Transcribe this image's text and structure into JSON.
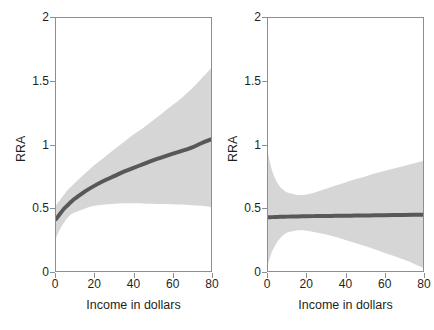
{
  "chart_data": [
    {
      "type": "line",
      "panel": "left",
      "title": "Real",
      "xlabel": "Income in dollars",
      "ylabel": "RRA",
      "xlim": [
        0,
        80
      ],
      "ylim": [
        0,
        2
      ],
      "xticks": [
        0,
        20,
        40,
        60,
        80
      ],
      "xtick_labels": [
        "0",
        "20",
        "40",
        "60",
        "80"
      ],
      "yticks": [
        0,
        0.5,
        1,
        1.5,
        2
      ],
      "ytick_labels": [
        "0",
        "0.5",
        "1",
        "1.5",
        "2"
      ],
      "grid": false,
      "legend": "none",
      "line_color": "#585858",
      "band_color": "#d6d6d6",
      "x": [
        0,
        2,
        4,
        6,
        8,
        10,
        15,
        20,
        25,
        30,
        35,
        40,
        45,
        50,
        55,
        60,
        65,
        70,
        75,
        80
      ],
      "series": [
        {
          "name": "fit",
          "values": [
            0.41,
            0.45,
            0.49,
            0.52,
            0.55,
            0.575,
            0.63,
            0.675,
            0.715,
            0.75,
            0.785,
            0.815,
            0.845,
            0.875,
            0.9,
            0.925,
            0.95,
            0.975,
            1.01,
            1.04
          ]
        },
        {
          "name": "ci_upper",
          "values": [
            0.52,
            0.56,
            0.6,
            0.64,
            0.67,
            0.7,
            0.77,
            0.84,
            0.9,
            0.96,
            1.02,
            1.08,
            1.13,
            1.19,
            1.25,
            1.31,
            1.37,
            1.44,
            1.52,
            1.6
          ]
        },
        {
          "name": "ci_lower",
          "values": [
            0.26,
            0.33,
            0.38,
            0.42,
            0.45,
            0.465,
            0.495,
            0.515,
            0.525,
            0.532,
            0.535,
            0.535,
            0.534,
            0.532,
            0.53,
            0.528,
            0.525,
            0.52,
            0.515,
            0.505
          ]
        }
      ]
    },
    {
      "type": "line",
      "panel": "right",
      "title": "Hypothetical",
      "xlabel": "Income in dollars",
      "ylabel": "RRA",
      "xlim": [
        0,
        80
      ],
      "ylim": [
        0,
        2
      ],
      "xticks": [
        0,
        20,
        40,
        60,
        80
      ],
      "xtick_labels": [
        "0",
        "20",
        "40",
        "60",
        "80"
      ],
      "yticks": [
        0,
        0.5,
        1,
        1.5,
        2
      ],
      "ytick_labels": [
        "0",
        "0.5",
        "1",
        "1.5",
        "2"
      ],
      "grid": false,
      "legend": "none",
      "line_color": "#585858",
      "band_color": "#d6d6d6",
      "x": [
        0,
        2,
        4,
        6,
        8,
        10,
        14,
        17,
        20,
        25,
        30,
        35,
        40,
        45,
        50,
        55,
        60,
        65,
        70,
        75,
        80
      ],
      "series": [
        {
          "name": "fit",
          "values": [
            0.425,
            0.426,
            0.427,
            0.428,
            0.429,
            0.43,
            0.431,
            0.432,
            0.433,
            0.434,
            0.435,
            0.436,
            0.437,
            0.438,
            0.439,
            0.44,
            0.441,
            0.442,
            0.443,
            0.444,
            0.445
          ]
        },
        {
          "name": "ci_upper",
          "values": [
            0.93,
            0.8,
            0.72,
            0.67,
            0.64,
            0.62,
            0.605,
            0.6,
            0.605,
            0.625,
            0.65,
            0.675,
            0.7,
            0.725,
            0.745,
            0.77,
            0.79,
            0.81,
            0.83,
            0.85,
            0.87
          ]
        },
        {
          "name": "ci_lower",
          "values": [
            0.055,
            0.15,
            0.21,
            0.255,
            0.285,
            0.305,
            0.318,
            0.322,
            0.318,
            0.305,
            0.288,
            0.268,
            0.245,
            0.222,
            0.198,
            0.172,
            0.145,
            0.118,
            0.09,
            0.06,
            0.025
          ]
        }
      ]
    }
  ]
}
